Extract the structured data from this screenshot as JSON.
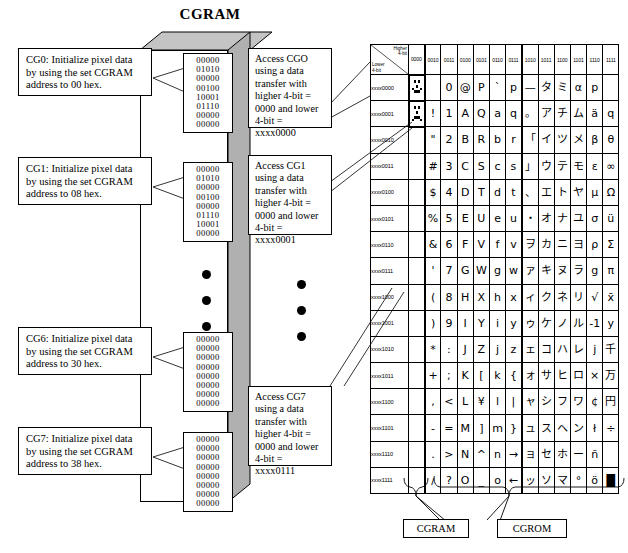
{
  "title": "CGRAM",
  "cgram_block": {
    "label": "CGRAM"
  },
  "cg_entries": [
    {
      "name": "CG0",
      "rows": [
        "00000",
        "01010",
        "00000",
        "00100",
        "10001",
        "01110",
        "00000",
        "00000"
      ]
    },
    {
      "name": "CG1",
      "rows": [
        "00000",
        "01010",
        "00000",
        "00100",
        "00000",
        "01110",
        "10001",
        "00000"
      ]
    },
    {
      "name": "CG6",
      "rows": [
        "00000",
        "00000",
        "00000",
        "00000",
        "00000",
        "00000",
        "00000",
        "00000"
      ]
    },
    {
      "name": "CG7",
      "rows": [
        "00000",
        "00000",
        "00000",
        "00000",
        "00000",
        "00000",
        "00000",
        "00000"
      ]
    }
  ],
  "left_callouts": [
    {
      "id": "cg0",
      "text": "CG0: Initialize pixel data by using the set CGRAM address to 00 hex."
    },
    {
      "id": "cg1",
      "text": "CG1: Initialize pixel data by using the set CGRAM address to 08 hex."
    },
    {
      "id": "cg6",
      "text": "CG6: Initialize pixel data by using the set CGRAM address to 30 hex."
    },
    {
      "id": "cg7",
      "text": "CG7: Initialize pixel data by using the set CGRAM address to 38 hex."
    }
  ],
  "mid_callouts": [
    {
      "id": "cg0",
      "text": "Access CGO using a data transfer with higher 4-bit = 0000 and lower 4-bit = xxxx0000"
    },
    {
      "id": "cg1",
      "text": "Access CG1 using a data transfer with higher 4-bit = 0000 and lower 4-bit = xxxx0001"
    },
    {
      "id": "cg7",
      "text": "Access CG7 using a data transfer with higher 4-bit = 0000 and lower 4-bit = xxxx0111"
    }
  ],
  "table": {
    "corner_higher": "Higher\n4-bit",
    "corner_lower": "Lower\n4-bit",
    "columns": [
      "0000",
      "0010",
      "0011",
      "0100",
      "0101",
      "0110",
      "0111",
      "1010",
      "1011",
      "1100",
      "1101",
      "1110",
      "1111"
    ],
    "rows": [
      "xxxx0000",
      "xxxx0001",
      "xxxx0010",
      "xxxx0011",
      "xxxx0100",
      "xxxx0101",
      "xxxx0110",
      "xxxx0111",
      "xxxx1000",
      "xxxx1001",
      "xxxx1010",
      "xxxx1011",
      "xxxx1100",
      "xxxx1101",
      "xxxx1110",
      "xxxx1111"
    ],
    "cells": [
      [
        "CG0",
        " ",
        "0",
        "@",
        "P",
        "`",
        "p",
        "—",
        "タ",
        "ミ",
        "α",
        "p"
      ],
      [
        "CG1",
        "!",
        "1",
        "A",
        "Q",
        "a",
        "q",
        "。",
        "ア",
        "チ",
        "ム",
        "ä",
        "q"
      ],
      [
        "CG2",
        "\"",
        "2",
        "B",
        "R",
        "b",
        "r",
        "「",
        "イ",
        "ツ",
        "メ",
        "β",
        "θ"
      ],
      [
        "CG3",
        "#",
        "3",
        "C",
        "S",
        "c",
        "s",
        "」",
        "ウ",
        "テ",
        "モ",
        "ε",
        "∞"
      ],
      [
        "CG4",
        "$",
        "4",
        "D",
        "T",
        "d",
        "t",
        "、",
        "エ",
        "ト",
        "ヤ",
        "μ",
        "Ω"
      ],
      [
        "CG5",
        "%",
        "5",
        "E",
        "U",
        "e",
        "u",
        "・",
        "オ",
        "ナ",
        "ユ",
        "σ",
        "ü"
      ],
      [
        "CG6",
        "&",
        "6",
        "F",
        "V",
        "f",
        "v",
        "ヲ",
        "カ",
        "ニ",
        "ヨ",
        "ρ",
        "Σ"
      ],
      [
        "CG7",
        "'",
        "7",
        "G",
        "W",
        "g",
        "w",
        "ァ",
        "キ",
        "ヌ",
        "ラ",
        "g",
        "π"
      ],
      [
        "CG0",
        "(",
        "8",
        "H",
        "X",
        "h",
        "x",
        "ィ",
        "ク",
        "ネ",
        "リ",
        "√",
        "x̄"
      ],
      [
        "CG1",
        ")",
        "9",
        "I",
        "Y",
        "i",
        "y",
        "ゥ",
        "ケ",
        "ノ",
        "ル",
        "-1",
        "y"
      ],
      [
        "CG2",
        "*",
        ":",
        "J",
        "Z",
        "j",
        "z",
        "ェ",
        "コ",
        "ハ",
        "レ",
        "j",
        "千"
      ],
      [
        "CG3",
        "+",
        ";",
        "K",
        "[",
        "k",
        "{",
        "ォ",
        "サ",
        "ヒ",
        "ロ",
        "×",
        "万"
      ],
      [
        "CG4",
        ",",
        "<",
        "L",
        "¥",
        "l",
        "|",
        "ャ",
        "シ",
        "フ",
        "ワ",
        "¢",
        "円"
      ],
      [
        "CG5",
        "-",
        "=",
        "M",
        "]",
        "m",
        "}",
        "ュ",
        "ス",
        "ヘ",
        "ン",
        "ł",
        "÷"
      ],
      [
        "CG6",
        ".",
        ">",
        "N",
        "^",
        "n",
        "→",
        "ョ",
        "セ",
        "ホ",
        "ー",
        "ñ",
        " "
      ],
      [
        "CG7",
        "/",
        "?",
        "O",
        "_",
        "o",
        "←",
        "ッ",
        "ソ",
        "マ",
        "°",
        "ö",
        "█"
      ]
    ]
  },
  "bottom_tags": [
    {
      "id": "cgram",
      "label": "CGRAM"
    },
    {
      "id": "cgrom",
      "label": "CGROM"
    }
  ]
}
